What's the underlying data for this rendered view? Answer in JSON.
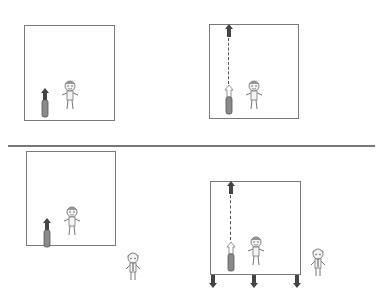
{
  "panels": [
    {
      "id": "top-left",
      "frame": {
        "x": 24,
        "y": 25,
        "w": 91,
        "h": 96
      },
      "rocket_state": "at-rest",
      "label": ""
    },
    {
      "id": "top-right",
      "frame": {
        "x": 209,
        "y": 24,
        "w": 90,
        "h": 95
      },
      "rocket_state": "launched-to-top",
      "label": ""
    },
    {
      "id": "bottom-left",
      "frame": {
        "x": 26,
        "y": 151,
        "w": 90,
        "h": 95
      },
      "rocket_state": "at-rest",
      "label": ""
    },
    {
      "id": "bottom-right",
      "frame": {
        "x": 210,
        "y": 181,
        "w": 91,
        "h": 94
      },
      "rocket_state": "launched-to-top-box-moving-down",
      "label": ""
    }
  ],
  "divider": {
    "x1": 8,
    "x2": 375,
    "y": 145
  },
  "colors": {
    "frame": "#7a7a7a",
    "rocket_body": "#8a8a8a",
    "arrow_dark": "#444444",
    "dashed": "#555555"
  }
}
